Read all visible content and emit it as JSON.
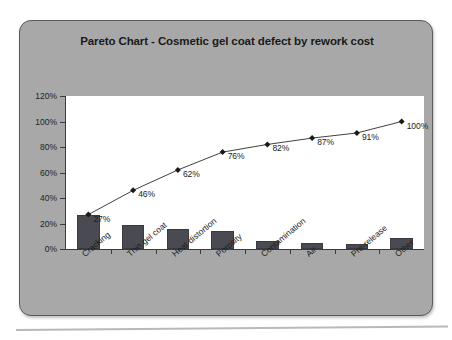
{
  "chart_data": {
    "type": "bar",
    "title": "Pareto Chart - Cosmetic gel coat defect by rework cost",
    "xlabel": "",
    "ylabel": "",
    "ylim": [
      0,
      120
    ],
    "ytick_labels": [
      "0%",
      "20%",
      "40%",
      "60%",
      "80%",
      "100%",
      "120%"
    ],
    "ytick_values": [
      0,
      20,
      40,
      60,
      80,
      100,
      120
    ],
    "grid": false,
    "legend": false,
    "categories": [
      "Cracking",
      "Thin gel coat",
      "Heat distortion",
      "Porosity",
      "Contamination",
      "Air",
      "Pre-release",
      "Other"
    ],
    "series": [
      {
        "name": "Defect by rework cost",
        "type": "bar",
        "values": [
          27,
          19,
          16,
          14,
          6,
          5,
          4,
          9
        ]
      },
      {
        "name": "Cumulative percentage",
        "type": "line",
        "values": [
          27,
          46,
          62,
          76,
          82,
          87,
          91,
          100
        ],
        "data_labels": [
          "27%",
          "46%",
          "62%",
          "76%",
          "82%",
          "87%",
          "91%",
          "100%"
        ]
      }
    ]
  },
  "colors": {
    "panel_background": "#a8a8a8",
    "panel_border": "#5a5a5a",
    "plot_background": "#ffffff",
    "axis": "#3b3b3b",
    "bar_fill": "#4a4a52",
    "line": "#2b2b2b",
    "text": "#1a1a1a"
  }
}
